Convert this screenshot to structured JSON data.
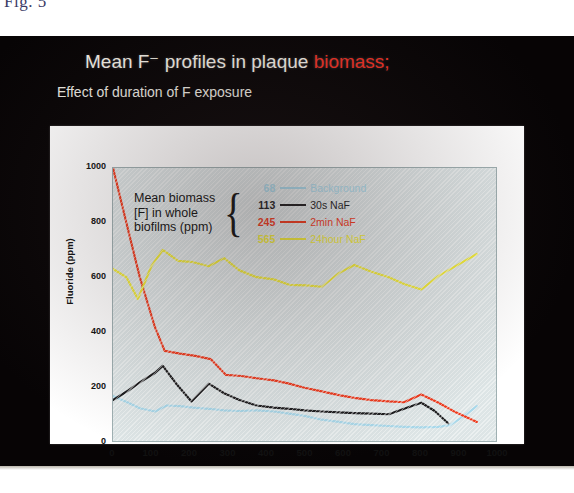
{
  "page": {
    "figure_label": "Fig. 5"
  },
  "slide": {
    "title_plain": "Mean F⁻ profiles in plaque ",
    "title_highlight": "biomass;",
    "title_highlight_color": "#ef3124",
    "subtitle": "Effect of duration of F exposure"
  },
  "legend": {
    "title_lines": [
      "Mean biomass",
      "[F] in whole",
      "biofilms (ppm)"
    ],
    "brace": "{",
    "rows": [
      {
        "value": "68",
        "label": "Background",
        "color": "#a8d8ea"
      },
      {
        "value": "113",
        "label": "30s NaF",
        "color": "#1d1d1f"
      },
      {
        "value": "245",
        "label": "2min NaF",
        "color": "#ef3b1e"
      },
      {
        "value": "565",
        "label": "24hour NaF",
        "color": "#f0ea3a"
      }
    ]
  },
  "chart_data": {
    "type": "line",
    "xlabel": "Distance from salivary surface (µm)",
    "ylabel": "Fluoride (ppm)",
    "xlim": [
      0,
      1000
    ],
    "ylim": [
      0,
      1000
    ],
    "xticks": [
      0,
      100,
      200,
      300,
      400,
      500,
      600,
      700,
      800,
      900,
      1000
    ],
    "yticks": [
      0,
      200,
      400,
      600,
      800,
      1000
    ],
    "grid": false,
    "legend_position": "inside-top-right",
    "plot_background": "#dde5e6",
    "series": [
      {
        "name": "Background",
        "color": "#a8d8ea",
        "mean_biomass_ppm": 68,
        "x": [
          0,
          40,
          70,
          110,
          140,
          175,
          210,
          250,
          290,
          330,
          375,
          420,
          460,
          500,
          545,
          590,
          630,
          675,
          720,
          760,
          805,
          850,
          880,
          915,
          950
        ],
        "y": [
          165,
          140,
          120,
          108,
          130,
          128,
          122,
          118,
          112,
          110,
          112,
          108,
          100,
          92,
          78,
          70,
          62,
          58,
          55,
          52,
          50,
          52,
          58,
          90,
          128
        ]
      },
      {
        "name": "30s NaF",
        "color": "#1d1d1f",
        "mean_biomass_ppm": 113,
        "x": [
          0,
          40,
          70,
          110,
          130,
          165,
          205,
          250,
          290,
          330,
          375,
          420,
          460,
          500,
          545,
          590,
          630,
          675,
          720,
          760,
          805,
          840,
          875
        ],
        "y": [
          150,
          185,
          215,
          250,
          275,
          210,
          145,
          210,
          175,
          150,
          130,
          122,
          118,
          112,
          108,
          105,
          102,
          100,
          98,
          118,
          140,
          110,
          65
        ]
      },
      {
        "name": "2min NaF",
        "color": "#ef3b1e",
        "mean_biomass_ppm": 245,
        "x": [
          0,
          40,
          70,
          110,
          135,
          175,
          215,
          255,
          295,
          335,
          375,
          420,
          460,
          500,
          545,
          590,
          630,
          675,
          720,
          760,
          805,
          850,
          895,
          950
        ],
        "y": [
          1000,
          770,
          600,
          415,
          330,
          320,
          312,
          300,
          242,
          238,
          230,
          222,
          210,
          195,
          182,
          168,
          158,
          150,
          145,
          142,
          170,
          140,
          105,
          70
        ]
      },
      {
        "name": "24hour NaF",
        "color": "#f0ea3a",
        "mean_biomass_ppm": 565,
        "x": [
          0,
          35,
          65,
          100,
          130,
          170,
          210,
          250,
          290,
          330,
          375,
          420,
          460,
          505,
          545,
          590,
          630,
          675,
          720,
          760,
          805,
          850,
          900,
          950
        ],
        "y": [
          630,
          600,
          520,
          640,
          700,
          660,
          655,
          640,
          670,
          625,
          600,
          592,
          572,
          570,
          565,
          615,
          645,
          620,
          600,
          575,
          555,
          605,
          645,
          685
        ]
      }
    ]
  }
}
